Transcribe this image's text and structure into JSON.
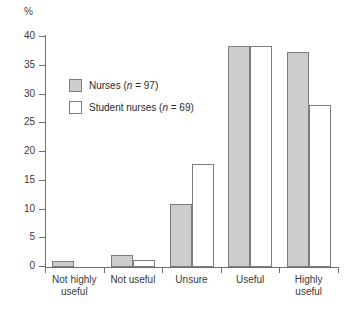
{
  "chart_data": {
    "type": "bar",
    "title": "",
    "xlabel": "",
    "ylabel": "%",
    "ylim": [
      0,
      40
    ],
    "ytick_step": 5,
    "grid": false,
    "legend_position": "inside-upper-left",
    "categories": [
      "Not highly useful",
      "Not useful",
      "Unsure",
      "Useful",
      "Highly useful"
    ],
    "category_lines": [
      [
        "Not highly",
        "useful"
      ],
      [
        "Not useful",
        ""
      ],
      [
        "Unsure",
        ""
      ],
      [
        "Useful",
        ""
      ],
      [
        "Highly",
        "useful"
      ]
    ],
    "ytick_labels": [
      "0",
      "5",
      "10",
      "15",
      "20",
      "25",
      "30",
      "35",
      "40"
    ],
    "ytick_values": [
      0,
      5,
      10,
      15,
      20,
      25,
      30,
      35,
      40
    ],
    "series": [
      {
        "name": "Nurses",
        "legend_label": "Nurses (n = 97)",
        "legend_prefix": "Nurses (",
        "legend_italic": "n",
        "legend_suffix": " = 97)",
        "n": 97,
        "color": "#cdcdcd",
        "values": [
          1.0,
          2.1,
          11.0,
          38.4,
          37.4
        ]
      },
      {
        "name": "Student nurses",
        "legend_label": "Student nurses (n = 69)",
        "legend_prefix": "Student nurses (",
        "legend_italic": "n",
        "legend_suffix": " = 69)",
        "n": 69,
        "color": "#ffffff",
        "values": [
          0.0,
          1.2,
          18.0,
          38.4,
          28.2
        ]
      }
    ]
  },
  "colors": {
    "series_a": "#cdcdcd",
    "series_b": "#ffffff",
    "outline": "#7d7d7d",
    "axis": "#6f6f6f",
    "text": "#2b2b2b"
  }
}
